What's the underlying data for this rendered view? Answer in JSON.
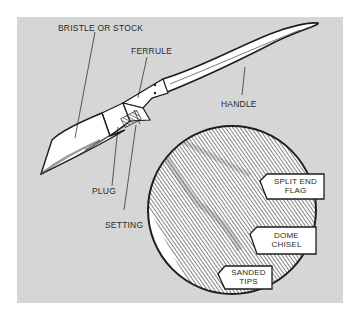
{
  "diagram": {
    "labels": {
      "bristle": "BRISTLE OR STOCK",
      "ferrule": "FERRULE",
      "handle": "HANDLE",
      "plug": "PLUG",
      "setting": "SETTING"
    },
    "detail_tags": [
      {
        "line1": "SPLIT END",
        "line2": "FLAG"
      },
      {
        "line1": "DOME",
        "line2": "CHISEL"
      },
      {
        "line1": "SANDED",
        "line2": "TIPS"
      }
    ],
    "colors": {
      "background": "#ffffff",
      "panel": "#d6d6d6",
      "ink": "#1e1e1e",
      "fill": "#ffffff"
    }
  }
}
